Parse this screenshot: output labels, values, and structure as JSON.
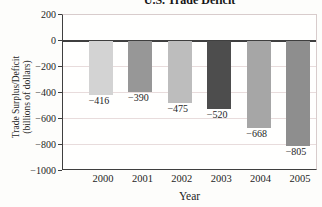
{
  "chart_data": {
    "type": "bar",
    "title": "U.S. Trade Deficit",
    "xlabel": "Year",
    "ylabel": "Trade Surplus/Deficit (billions of dollars)",
    "ylabel_line1": "Trade Surplus/Deficit",
    "ylabel_line2": "(billions of dollars)",
    "categories": [
      "2000",
      "2001",
      "2002",
      "2003",
      "2004",
      "2005"
    ],
    "values": [
      -416,
      -390,
      -475,
      -520,
      -668,
      -805
    ],
    "bar_labels": [
      "−416",
      "−390",
      "−475",
      "−520",
      "−668",
      "−805"
    ],
    "bar_colors": [
      "#d3d3d3",
      "#979797",
      "#bdbdbd",
      "#4d4d4d",
      "#a6a6a6",
      "#8e8e8e"
    ],
    "ylim": [
      -1000,
      200
    ],
    "yticks": [
      200,
      0,
      -200,
      -400,
      -600,
      -800,
      -1000
    ],
    "ytick_labels": [
      "200",
      "0",
      "−200",
      "−400",
      "−600",
      "−800",
      "−1000"
    ],
    "grid": "horizontal",
    "legend": "none",
    "colors": {
      "axis": "#3f3f3f",
      "gridline": "#e8dcdc",
      "frame": "#d8cccc",
      "text": "#1e1e1e",
      "background": "#fdfdfb"
    }
  }
}
